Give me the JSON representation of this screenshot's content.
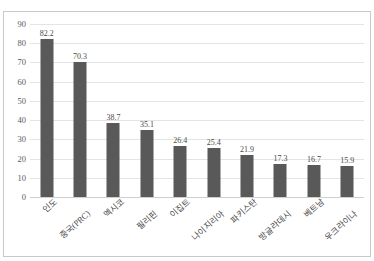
{
  "top_caption": "",
  "axis": {
    "y_ticks": [
      "90",
      "80",
      "70",
      "60",
      "50",
      "40",
      "30",
      "20",
      "10",
      "0"
    ]
  },
  "colors": {
    "bar": "#595959",
    "gridline": "#e4e4e4",
    "frame": "#c9c9c9",
    "text": "#4a4a4a"
  },
  "chart_data": {
    "type": "bar",
    "title": "",
    "xlabel": "",
    "ylabel": "",
    "ylim": [
      0,
      90
    ],
    "ytick_step": 10,
    "grid": true,
    "legend": false,
    "categories": [
      "인도",
      "중국(PRC)",
      "멕시코",
      "필리핀",
      "이집트",
      "나이지리아",
      "파키스탄",
      "방글라데시",
      "베트남",
      "우크라이나"
    ],
    "values": [
      82.2,
      70.3,
      38.7,
      35.1,
      26.4,
      25.4,
      21.9,
      17.3,
      16.7,
      15.9
    ],
    "value_labels": [
      "82.2",
      "70.3",
      "38.7",
      "35.1",
      "26.4",
      "25.4",
      "21.9",
      "17.3",
      "16.7",
      "15.9"
    ]
  }
}
